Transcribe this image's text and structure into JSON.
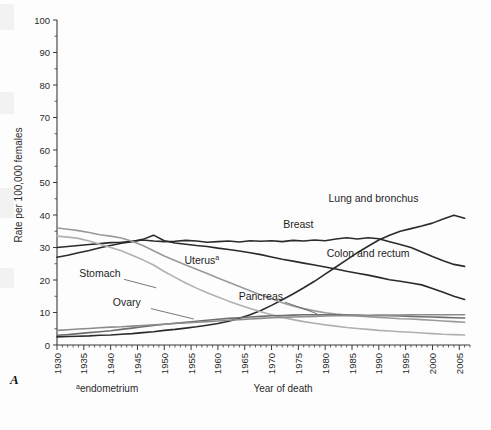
{
  "panel": {
    "letter": "A"
  },
  "footnote": {
    "marker": "a",
    "text": "endometrium"
  },
  "chart_data": {
    "type": "line",
    "title": "",
    "xlabel": "Year of death",
    "ylabel": "Rate per 100,000 females",
    "xlim": [
      1930,
      2007
    ],
    "ylim": [
      0,
      100
    ],
    "ytick_step": 10,
    "xtick_step": 5,
    "grid": false,
    "legend_position": "inline-annotations",
    "yticks": [
      "0",
      "10",
      "20",
      "30",
      "40",
      "50",
      "60",
      "70",
      "80",
      "90",
      "100"
    ],
    "xticks": [
      "1930",
      "1935",
      "1940",
      "1945",
      "1950",
      "1955",
      "1960",
      "1965",
      "1970",
      "1975",
      "1980",
      "1985",
      "1990",
      "1995",
      "2000",
      "2005"
    ],
    "x": [
      1930,
      1932,
      1934,
      1936,
      1938,
      1940,
      1942,
      1944,
      1946,
      1948,
      1950,
      1952,
      1954,
      1956,
      1958,
      1960,
      1962,
      1964,
      1966,
      1968,
      1970,
      1972,
      1974,
      1976,
      1978,
      1980,
      1982,
      1984,
      1986,
      1988,
      1990,
      1992,
      1994,
      1996,
      1998,
      2000,
      2002,
      2004,
      2006
    ],
    "series": [
      {
        "name": "Lung and bronchus",
        "label": "Lung and bronchus",
        "color": "#2b2b2b",
        "width": 1.6,
        "label_xy": [
          1989,
          44
        ],
        "values": [
          2.5,
          2.6,
          2.7,
          2.8,
          3.0,
          3.1,
          3.3,
          3.5,
          3.8,
          4.1,
          4.5,
          4.8,
          5.2,
          5.6,
          6.1,
          6.6,
          7.3,
          8.2,
          9.3,
          10.6,
          12.2,
          13.9,
          15.7,
          17.6,
          19.6,
          21.8,
          24.0,
          26.2,
          28.4,
          30.4,
          32.3,
          33.8,
          35.0,
          35.8,
          36.6,
          37.5,
          38.8,
          39.9,
          39.0
        ]
      },
      {
        "name": "Breast",
        "label": "Breast",
        "color": "#2b2b2b",
        "width": 1.6,
        "label_xy": [
          1975,
          36
        ],
        "values": [
          30.0,
          30.3,
          30.6,
          30.9,
          31.2,
          31.5,
          31.6,
          31.9,
          32.3,
          32.0,
          31.8,
          31.9,
          32.2,
          32.0,
          31.6,
          31.8,
          32.0,
          31.7,
          32.1,
          31.9,
          32.1,
          31.8,
          32.2,
          32.0,
          32.3,
          32.1,
          32.6,
          33.0,
          32.6,
          33.0,
          32.7,
          31.8,
          30.9,
          30.0,
          28.6,
          27.2,
          25.9,
          24.8,
          24.2
        ]
      },
      {
        "name": "Colon and rectum",
        "label": "Colon and rectum",
        "color": "#2b2b2b",
        "width": 1.6,
        "label_xy": [
          1988,
          27
        ],
        "values": [
          27.0,
          27.6,
          28.4,
          29.1,
          29.9,
          30.6,
          31.3,
          31.8,
          32.5,
          33.8,
          32.1,
          31.4,
          31.0,
          30.6,
          30.3,
          29.8,
          29.4,
          28.9,
          28.4,
          27.8,
          27.1,
          26.4,
          25.8,
          25.2,
          24.6,
          24.0,
          23.4,
          22.7,
          22.1,
          21.5,
          20.8,
          20.1,
          19.6,
          19.1,
          18.5,
          17.4,
          16.2,
          15.0,
          14.0
        ]
      },
      {
        "name": "Uterus",
        "label": "Uterus",
        "superscript": "a",
        "color": "#9a9a9a",
        "width": 1.6,
        "label_xy": [
          1957,
          25
        ],
        "values": [
          36.0,
          35.6,
          35.2,
          34.6,
          33.9,
          33.5,
          32.9,
          31.9,
          30.6,
          29.0,
          27.4,
          26.0,
          24.6,
          23.3,
          22.0,
          20.6,
          19.3,
          18.0,
          16.7,
          15.4,
          14.2,
          13.0,
          12.0,
          11.2,
          10.5,
          9.9,
          9.5,
          9.2,
          8.9,
          8.7,
          8.5,
          8.3,
          8.1,
          8.0,
          7.8,
          7.6,
          7.4,
          7.2,
          7.0
        ]
      },
      {
        "name": "Stomach",
        "label": "Stomach",
        "color": "#b0b0b0",
        "width": 1.6,
        "label_xy": [
          1938,
          21
        ],
        "values": [
          33.5,
          33.2,
          32.8,
          32.0,
          31.0,
          30.0,
          29.0,
          27.6,
          26.2,
          24.6,
          22.6,
          20.8,
          19.1,
          17.5,
          16.1,
          14.8,
          13.5,
          12.3,
          11.2,
          10.2,
          9.3,
          8.5,
          7.8,
          7.2,
          6.7,
          6.2,
          5.8,
          5.4,
          5.1,
          4.8,
          4.5,
          4.3,
          4.1,
          3.9,
          3.7,
          3.5,
          3.3,
          3.2,
          3.1
        ]
      },
      {
        "name": "Ovary",
        "label": "Ovary",
        "color": "#6e6e6e",
        "width": 1.6,
        "label_xy": [
          1943,
          12
        ],
        "values": [
          3.0,
          3.2,
          3.5,
          3.8,
          4.1,
          4.4,
          4.8,
          5.2,
          5.6,
          6.0,
          6.4,
          6.7,
          7.0,
          7.3,
          7.6,
          7.9,
          8.2,
          8.4,
          8.6,
          8.8,
          9.0,
          9.1,
          9.2,
          9.3,
          9.3,
          9.3,
          9.3,
          9.2,
          9.2,
          9.1,
          9.1,
          9.0,
          8.9,
          8.8,
          8.7,
          8.6,
          8.5,
          8.4,
          8.3
        ]
      },
      {
        "name": "Pancreas",
        "label": "Pancreas",
        "color": "#8c8c8c",
        "width": 1.6,
        "label_xy": [
          1968,
          14
        ],
        "values": [
          4.5,
          4.7,
          4.9,
          5.1,
          5.3,
          5.5,
          5.6,
          5.8,
          6.0,
          6.2,
          6.4,
          6.6,
          6.8,
          7.0,
          7.2,
          7.4,
          7.6,
          7.8,
          8.0,
          8.2,
          8.4,
          8.5,
          8.6,
          8.7,
          8.8,
          8.9,
          9.0,
          9.0,
          9.1,
          9.1,
          9.2,
          9.2,
          9.2,
          9.3,
          9.3,
          9.3,
          9.3,
          9.3,
          9.3
        ]
      }
    ]
  }
}
